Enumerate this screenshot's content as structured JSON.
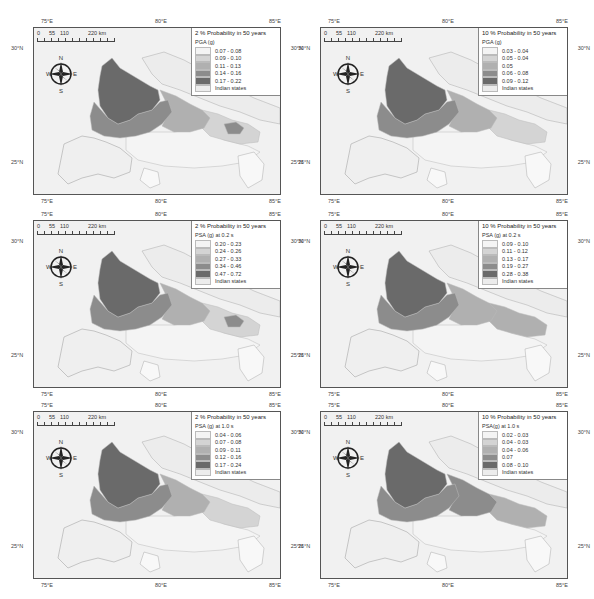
{
  "figure": {
    "axes": {
      "lon_ticks": [
        "75°E",
        "80°E",
        "85°E"
      ],
      "lat_ticks": [
        "30°N",
        "25°N"
      ]
    },
    "scalebar": {
      "labels": [
        "0",
        "55",
        "110",
        "220 km"
      ]
    },
    "compass": {
      "n": "N",
      "s": "S",
      "e": "E",
      "w": "W"
    },
    "colors": {
      "class1": "#f4f4f4",
      "class2": "#d4d4d4",
      "class3": "#b0b0b0",
      "class4": "#8c8c8c",
      "class5": "#6a6a6a",
      "indian_states": "#ececec",
      "background": "#f1f1f1"
    },
    "panels": [
      {
        "title": "2 % Probability in 50 years",
        "variable": "PGA (g)",
        "classes": [
          "0.07 - 0.08",
          "0.09 - 0.10",
          "0.11 - 0.13",
          "0.14 - 0.16",
          "0.17 - 0.22"
        ],
        "other": "Indian states"
      },
      {
        "title": "10 % Probability in 50 years",
        "variable": "PGA (g)",
        "classes": [
          "0.03 - 0.04",
          "0.05 - 0.04",
          "0.05",
          "0.06 - 0.08",
          "0.09 - 0.12"
        ],
        "other": "Indian states"
      },
      {
        "title": "2 % Probability in 50 years",
        "variable": "PSA (g) at 0.2 s",
        "classes": [
          "0.20 - 0.23",
          "0.24 - 0.26",
          "0.27 - 0.33",
          "0.34 - 0.46",
          "0.47 - 0.72"
        ],
        "other": "Indian states"
      },
      {
        "title": "10 % Probability in 50 years",
        "variable": "PSA (g) at 0.2 s",
        "classes": [
          "0.09 - 0.10",
          "0.11 - 0.12",
          "0.13 - 0.17",
          "0.19 - 0.27",
          "0.28 - 0.38"
        ],
        "other": "Indian states"
      },
      {
        "title": "2 % Probability in 50 years",
        "variable": "PSA (g) at 1.0 s",
        "classes": [
          "0.04 - 0.06",
          "0.07 - 0.08",
          "0.09 - 0.11",
          "0.12 - 0.16",
          "0.17 - 0.24"
        ],
        "other": "Indian states"
      },
      {
        "title": "10 % Probability in 50 years",
        "variable": "PSA(g) at 1.0 s",
        "classes": [
          "0.02 - 0.03",
          "0.04 - 0.03",
          "0.04 - 0.06",
          "0.07",
          "0.08 - 0.10"
        ],
        "other": "Indian states"
      }
    ]
  }
}
